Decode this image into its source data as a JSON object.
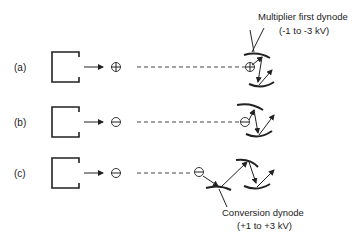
{
  "rows": [
    {
      "label": "(a)",
      "ion": "positive-ion"
    },
    {
      "label": "(b)",
      "ion": "negative-ion"
    },
    {
      "label": "(c)",
      "ion": "negative-ion"
    }
  ],
  "annotations": {
    "multiplier_line1": "Multiplier first dynode",
    "multiplier_line2": "(-1 to -3 kV)",
    "conversion_line1": "Conversion dynode",
    "conversion_line2": "(+1 to +3 kV)"
  }
}
